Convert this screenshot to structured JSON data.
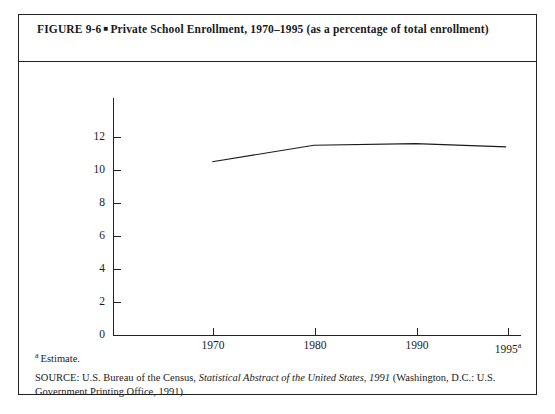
{
  "figure": {
    "number": "FIGURE 9-6",
    "bullet": "■",
    "title": "Private School Enrollment, 1970–1995 (as a percentage of total enrollment)",
    "title_line1": "FIGURE 9-6 ■ Private School Enrollment, 1970–1995 (as a percentage of",
    "title_line2": "total enrollment)"
  },
  "footnote": {
    "marker": "a",
    "text": "Estimate."
  },
  "source": {
    "prefix": "SOURCE: U.S. Bureau of the Census, ",
    "italic": "Statistical Abstract of the United States, 1991",
    "suffix": " (Washington, D.C.: U.S. Government Printing Office, 1991)."
  },
  "chart_data": {
    "type": "line",
    "title": "Private School Enrollment, 1970–1995 (as a percentage of total enrollment)",
    "xlabel": "",
    "ylabel": "",
    "x": [
      1970,
      1980,
      1990,
      1995
    ],
    "categories": [
      "1970",
      "1980",
      "1990",
      "1995"
    ],
    "x_tick_labels": [
      "1970",
      "1980",
      "1990",
      "1995"
    ],
    "x_tick_superscripts": [
      "",
      "",
      "",
      "a"
    ],
    "values": [
      10.5,
      11.5,
      11.6,
      11.4
    ],
    "series": [
      {
        "name": "Private school enrollment (% of total)",
        "values": [
          10.5,
          11.5,
          11.6,
          11.4
        ]
      }
    ],
    "ylim": [
      0,
      12.6
    ],
    "y_ticks": [
      0,
      2,
      4,
      6,
      8,
      10,
      12
    ],
    "y_tick_labels": [
      "0",
      "2",
      "4",
      "6",
      "8",
      "10",
      "12"
    ],
    "xlim": [
      1966,
      1998
    ],
    "grid": false,
    "legend": false,
    "line_color": "#1a1a1a",
    "markers": false,
    "axis_color": "#222222"
  }
}
